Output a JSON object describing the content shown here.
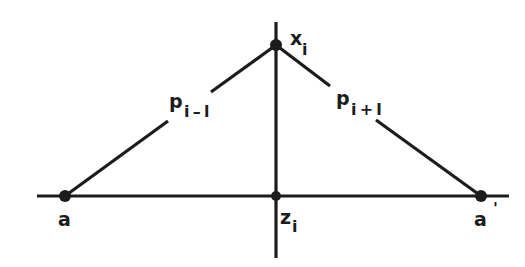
{
  "diagram": {
    "type": "geometric-construction",
    "stroke_color": "#1c1c1c",
    "background_color": "#ffffff",
    "axes": {
      "horizontal": {
        "x1": 37,
        "y1": 196,
        "x2": 509,
        "y2": 196
      },
      "vertical": {
        "x1": 276,
        "y1": 22,
        "x2": 276,
        "y2": 258
      }
    },
    "points": [
      {
        "id": "x_i",
        "label": "x",
        "subscript": "i",
        "cx": 276,
        "cy": 45
      },
      {
        "id": "a",
        "label": "a",
        "subscript": "",
        "cx": 65,
        "cy": 196
      },
      {
        "id": "z_i",
        "label": "z",
        "subscript": "i",
        "cx": 276,
        "cy": 196
      },
      {
        "id": "a_prime",
        "label": "a",
        "prime": "'",
        "cx": 481,
        "cy": 196
      }
    ],
    "edges": [
      {
        "id": "p_i_minus_1",
        "label": "p",
        "subscript": "i – l",
        "from": "a",
        "to": "x_i"
      },
      {
        "id": "p_i_plus_1",
        "label": "p",
        "subscript": "i + l",
        "from": "x_i",
        "to": "a_prime"
      }
    ]
  }
}
